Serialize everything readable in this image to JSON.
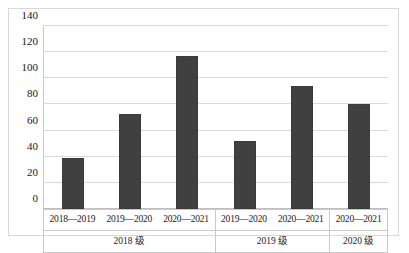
{
  "chart_data": {
    "type": "bar",
    "title": "",
    "xlabel": "",
    "ylabel": "",
    "ylim": [
      0,
      140
    ],
    "grid": true,
    "legend": "none",
    "categories": [
      "2018—2019",
      "2019—2020",
      "2020—2021",
      "2019—2020",
      "2020—2021",
      "2020—2021"
    ],
    "values": [
      39,
      73,
      117,
      52,
      94,
      80
    ],
    "yticks": [
      "0",
      "20",
      "40",
      "60",
      "80",
      "100",
      "120",
      "140"
    ],
    "ytick_values": [
      0,
      20,
      40,
      60,
      80,
      100,
      120,
      140
    ],
    "bar_color": "#404040",
    "gridline_color": "#d9d9d9",
    "groups": [
      {
        "name": "2018 级",
        "terms": [
          "2018—2019",
          "2019—2020",
          "2020—2021"
        ],
        "values": [
          39,
          73,
          117
        ]
      },
      {
        "name": "2019 级",
        "terms": [
          "2019—2020",
          "2020—2021"
        ],
        "values": [
          52,
          94
        ]
      },
      {
        "name": "2020 级",
        "terms": [
          "2020—2021"
        ],
        "values": [
          80
        ]
      }
    ]
  }
}
